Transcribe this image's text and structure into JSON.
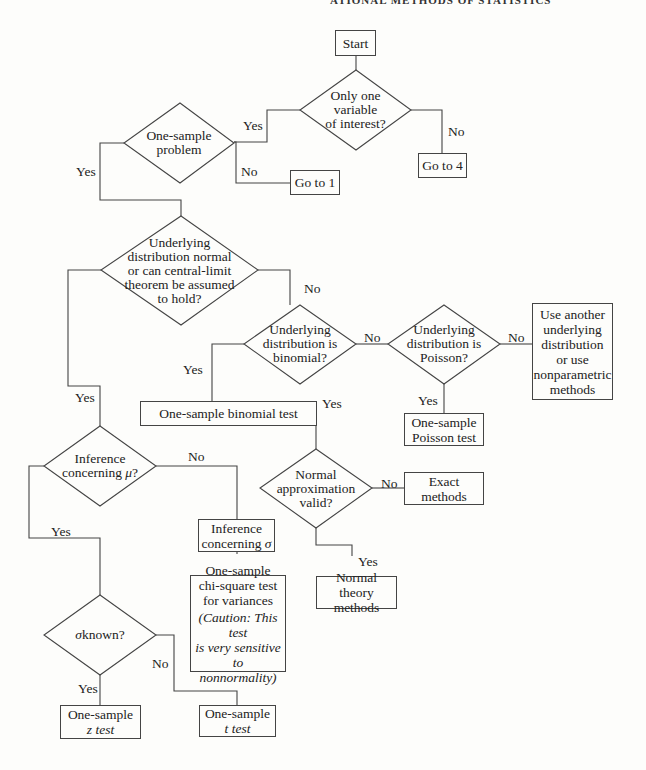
{
  "header": {
    "running_title": "ATIONAL METHODS OF STATISTICS"
  },
  "nodes": {
    "start": "Start",
    "only_one_variable": [
      "Only one",
      "variable",
      "of interest?"
    ],
    "one_sample_problem": [
      "One-sample",
      "problem"
    ],
    "go_to_1": "Go to 1",
    "go_to_4": "Go to 4",
    "underlying_normal": [
      "Underlying",
      "distribution normal",
      "or can central-limit",
      "theorem be assumed",
      "to hold?"
    ],
    "binomial_q": [
      "Underlying",
      "distribution is",
      "binomial?"
    ],
    "poisson_q": [
      "Underlying",
      "distribution is",
      "Poisson?"
    ],
    "other_methods": [
      "Use another",
      "underlying",
      "distribution",
      "or use",
      "nonparametric",
      "methods"
    ],
    "binomial_test": "One-sample binomial test",
    "poisson_test": [
      "One-sample",
      "Poisson test"
    ],
    "normal_approx_q": [
      "Normal",
      "approximation",
      "valid?"
    ],
    "exact_methods": [
      "Exact",
      "methods"
    ],
    "normal_theory": [
      "Normal theory",
      "methods"
    ],
    "inference_mu_q": [
      "Inference",
      "concerning μ?"
    ],
    "inference_sigma": [
      "Inference",
      "concerning σ"
    ],
    "chi_square": [
      "One-sample",
      "chi-square test",
      "for variances"
    ],
    "caution": [
      "(Caution: This test",
      "is very sensitive to",
      "nonnormality)"
    ],
    "sigma_known_q": "σ known?",
    "z_test": [
      "One-sample",
      "z test"
    ],
    "t_test": [
      "One-sample",
      "t test"
    ]
  },
  "edge_labels": {
    "yes": "Yes",
    "no": "No"
  }
}
